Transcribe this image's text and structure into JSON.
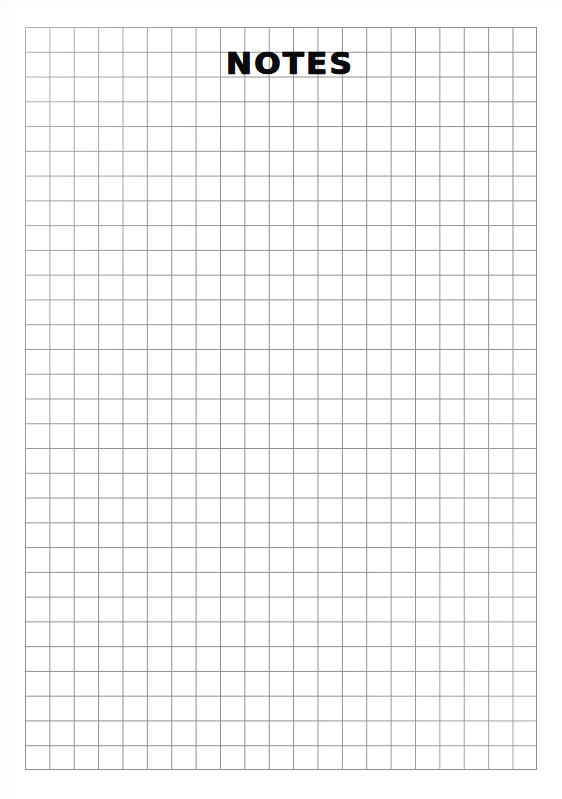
{
  "page": {
    "kind": "scanned-book-page",
    "background_color": "#ffffff",
    "width": 562,
    "height": 799
  },
  "running_head": {
    "title": "",
    "page_number": "",
    "note": "cropped at top edge of scan, illegible",
    "color": "#8d8d90"
  },
  "heading": {
    "text": "NOTES",
    "color": "#0b0b0b"
  },
  "grid": {
    "label": "blank squared note grid",
    "columns": 21,
    "rows": 30,
    "cell_width_px": 24.38,
    "cell_height_px": 24.77,
    "left_px": 25,
    "top_px": 27,
    "width_px": 512,
    "height_px": 743,
    "line_color": "#8e8e92",
    "line_width_px": 1,
    "fill_color": "#ffffff",
    "content": ""
  }
}
